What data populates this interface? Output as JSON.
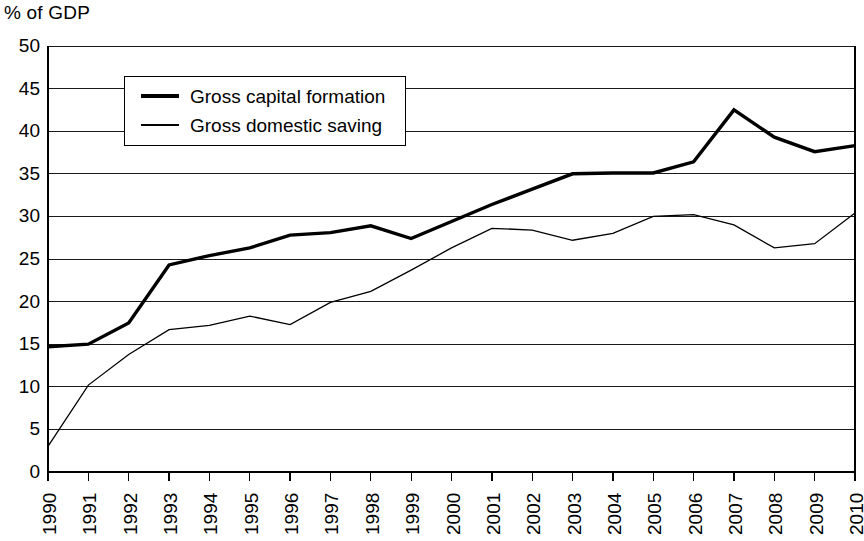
{
  "chart_data": {
    "type": "line",
    "title": "",
    "ylabel": "% of GDP",
    "xlabel": "",
    "ylim": [
      0,
      50
    ],
    "ytick_step": 5,
    "grid": true,
    "legend_position": "upper-left-inside",
    "categories": [
      "1990",
      "1991",
      "1992",
      "1993",
      "1994",
      "1995",
      "1996",
      "1997",
      "1998",
      "1999",
      "2000",
      "2001",
      "2002",
      "2003",
      "2004",
      "2005",
      "2006",
      "2007",
      "2008",
      "2009",
      "2010"
    ],
    "ytick_labels": [
      "50",
      "45",
      "40",
      "35",
      "30",
      "25",
      "20",
      "15",
      "10",
      "5",
      "0"
    ],
    "series": [
      {
        "name": "Gross capital formation",
        "style": "thick",
        "color": "#000000",
        "values": [
          14.7,
          15.0,
          17.5,
          24.3,
          25.4,
          26.3,
          27.8,
          28.1,
          28.9,
          27.4,
          29.4,
          31.4,
          33.2,
          35.0,
          35.1,
          35.1,
          36.4,
          42.5,
          39.3,
          37.6,
          38.3
        ]
      },
      {
        "name": "Gross domestic saving",
        "style": "thin",
        "color": "#000000",
        "values": [
          3.0,
          10.2,
          13.8,
          16.7,
          17.2,
          18.3,
          17.3,
          19.9,
          21.2,
          23.7,
          26.3,
          28.6,
          28.4,
          27.2,
          28.0,
          30.0,
          30.2,
          29.0,
          26.3,
          26.8,
          30.4
        ]
      }
    ]
  },
  "legend": {
    "entries": [
      {
        "label": "Gross capital formation"
      },
      {
        "label": "Gross domestic saving"
      }
    ]
  }
}
